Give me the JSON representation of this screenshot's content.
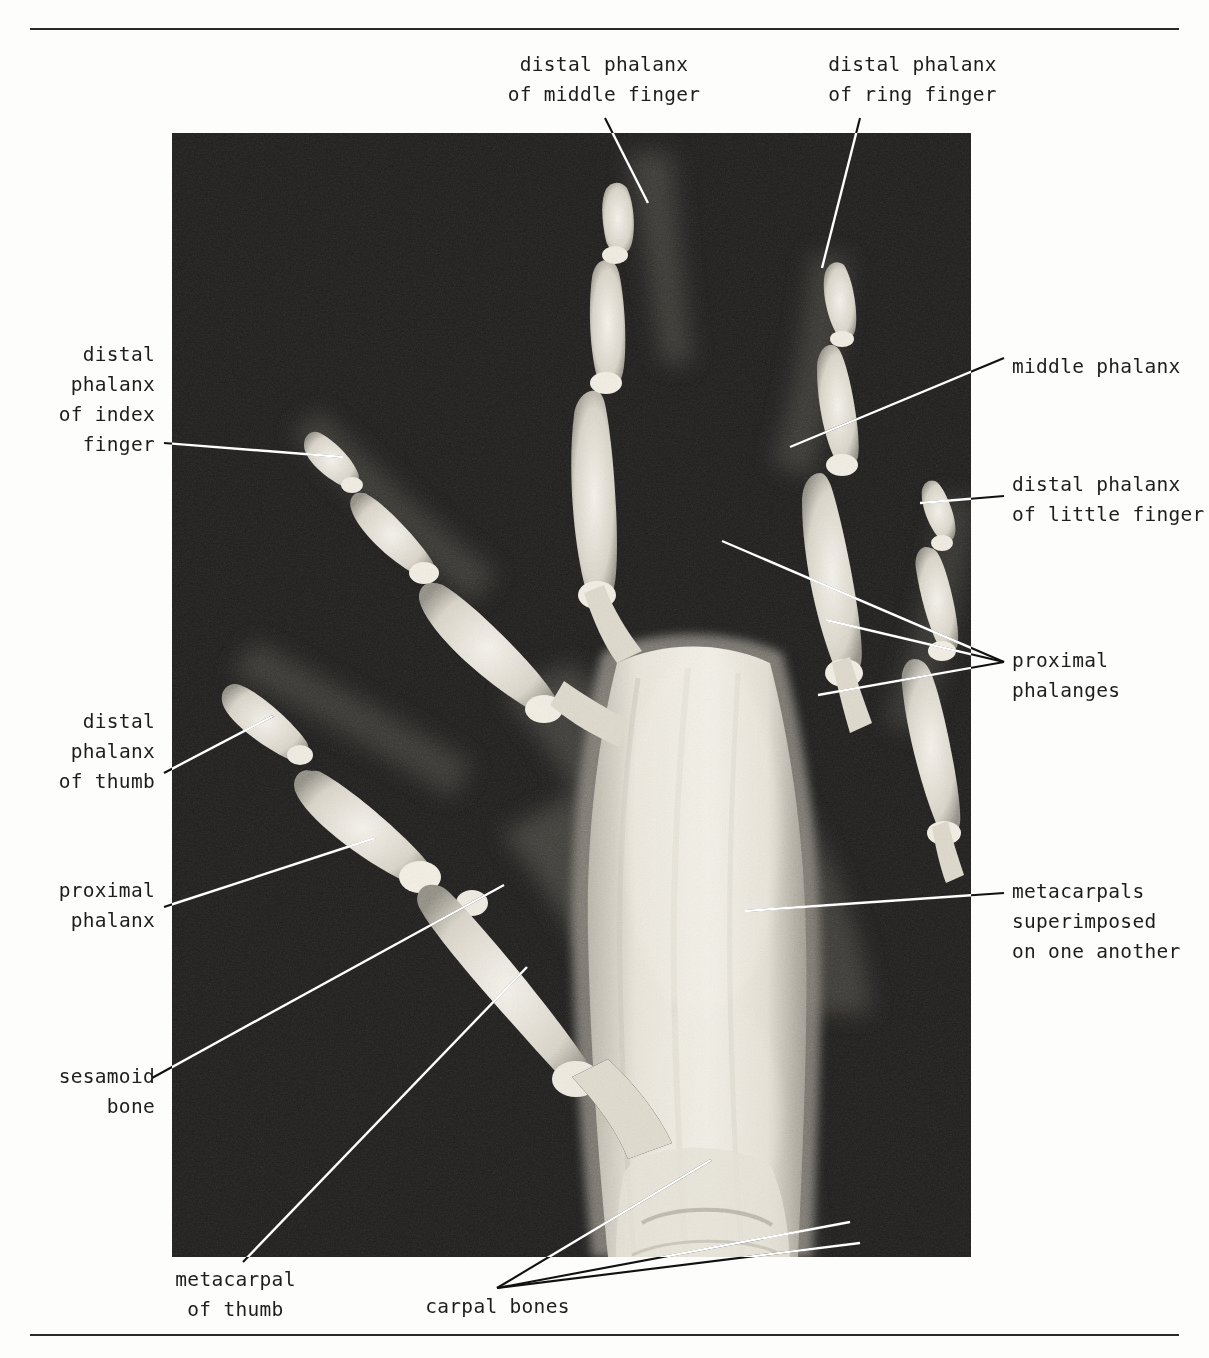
{
  "figure": {
    "type": "annotated-radiograph",
    "image_region": {
      "x": 172,
      "y": 133,
      "width": 799,
      "height": 1124
    },
    "rules": {
      "top_y": 28,
      "bottom_y": 1334
    },
    "colors": {
      "page_background": "#fdfdfb",
      "text": "#1d1d1d",
      "rule": "#2a2a2a",
      "film_background_dark": "#1a1a1a",
      "bone_bright": "#f2efe6",
      "leader_outside": "#111111",
      "leader_inside": "#ffffff"
    }
  },
  "labels": [
    {
      "id": "distal-phalanx-middle-finger",
      "text": "distal phalanx\nof middle finger",
      "align": "center",
      "x": 489,
      "y": 50,
      "width": 230
    },
    {
      "id": "distal-phalanx-ring-finger",
      "text": "distal phalanx\nof ring finger",
      "align": "center",
      "x": 805,
      "y": 50,
      "width": 215
    },
    {
      "id": "distal-phalanx-index-finger",
      "text": "distal\nphalanx\nof index\nfinger",
      "align": "right",
      "x": 30,
      "y": 340,
      "width": 125
    },
    {
      "id": "middle-phalanx",
      "text": "middle phalanx",
      "align": "left",
      "x": 1012,
      "y": 352,
      "width": 190
    },
    {
      "id": "distal-phalanx-little-finger",
      "text": "distal phalanx\nof little finger",
      "align": "left",
      "x": 1012,
      "y": 470,
      "width": 195
    },
    {
      "id": "proximal-phalanges",
      "text": "proximal\nphalanges",
      "align": "left",
      "x": 1012,
      "y": 646,
      "width": 145
    },
    {
      "id": "distal-phalanx-thumb",
      "text": "distal\nphalanx\nof thumb",
      "align": "right",
      "x": 30,
      "y": 707,
      "width": 125
    },
    {
      "id": "metacarpals-superimposed",
      "text": "metacarpals\nsuperimposed\non one another",
      "align": "left",
      "x": 1012,
      "y": 877,
      "width": 200
    },
    {
      "id": "proximal-phalanx",
      "text": "proximal\nphalanx",
      "align": "right",
      "x": 30,
      "y": 876,
      "width": 125
    },
    {
      "id": "sesamoid-bone",
      "text": "sesamoid\nbone",
      "align": "right",
      "x": 30,
      "y": 1062,
      "width": 125
    },
    {
      "id": "metacarpal-of-thumb",
      "text": "metacarpal\nof thumb",
      "align": "center",
      "x": 128,
      "y": 1265,
      "width": 215
    },
    {
      "id": "carpal-bones",
      "text": "carpal bones",
      "align": "center",
      "x": 395,
      "y": 1292,
      "width": 205
    }
  ],
  "leader_lines": [
    {
      "id": "leader-distal-phalanx-middle-finger",
      "points": [
        [
          605,
          118
        ],
        [
          648,
          203
        ]
      ]
    },
    {
      "id": "leader-distal-phalanx-ring-finger",
      "points": [
        [
          860,
          118
        ],
        [
          822,
          268
        ]
      ]
    },
    {
      "id": "leader-distal-phalanx-index-finger",
      "points": [
        [
          164,
          443
        ],
        [
          343,
          457
        ]
      ]
    },
    {
      "id": "leader-middle-phalanx",
      "points": [
        [
          1004,
          358
        ],
        [
          790,
          447
        ]
      ]
    },
    {
      "id": "leader-distal-phalanx-little-finger",
      "points": [
        [
          1004,
          496
        ],
        [
          920,
          503
        ]
      ]
    },
    {
      "id": "leader-proximal-phalanges-a",
      "points": [
        [
          1004,
          662
        ],
        [
          722,
          541
        ]
      ]
    },
    {
      "id": "leader-proximal-phalanges-b",
      "points": [
        [
          1004,
          662
        ],
        [
          826,
          620
        ]
      ]
    },
    {
      "id": "leader-proximal-phalanges-c",
      "points": [
        [
          1004,
          662
        ],
        [
          818,
          695
        ]
      ]
    },
    {
      "id": "leader-distal-phalanx-thumb",
      "points": [
        [
          164,
          773
        ],
        [
          273,
          716
        ]
      ]
    },
    {
      "id": "leader-metacarpals-superimposed",
      "points": [
        [
          1004,
          893
        ],
        [
          745,
          911
        ]
      ]
    },
    {
      "id": "leader-proximal-phalanx",
      "points": [
        [
          164,
          907
        ],
        [
          375,
          838
        ]
      ]
    },
    {
      "id": "leader-sesamoid-bone",
      "points": [
        [
          152,
          1078
        ],
        [
          504,
          885
        ]
      ]
    },
    {
      "id": "leader-metacarpal-of-thumb",
      "points": [
        [
          243,
          1262
        ],
        [
          527,
          967
        ]
      ]
    },
    {
      "id": "leader-carpal-bones-a",
      "points": [
        [
          497,
          1288
        ],
        [
          711,
          1160
        ]
      ]
    },
    {
      "id": "leader-carpal-bones-b",
      "points": [
        [
          497,
          1288
        ],
        [
          850,
          1222
        ]
      ]
    },
    {
      "id": "leader-carpal-bones-c",
      "points": [
        [
          497,
          1288
        ],
        [
          860,
          1243
        ]
      ]
    }
  ]
}
